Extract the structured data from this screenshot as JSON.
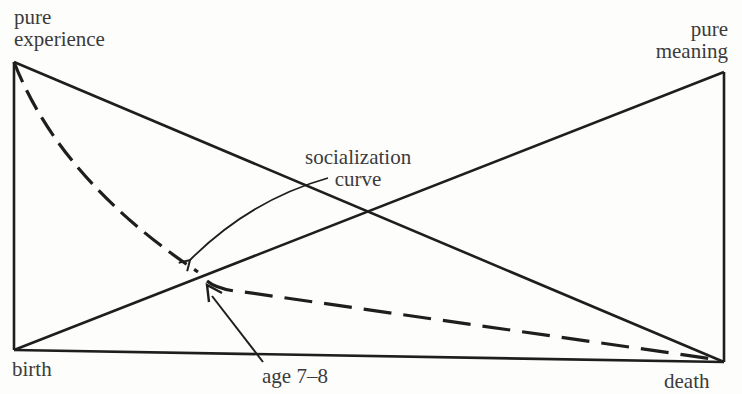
{
  "diagram": {
    "type": "conceptual-life-diagram",
    "labels": {
      "top_left": [
        "pure",
        "experience"
      ],
      "top_right": [
        "pure",
        "meaning"
      ],
      "socialization": [
        "socialization",
        "curve"
      ],
      "bottom_left": "birth",
      "bottom_right": "death",
      "age_marker": "age 7–8"
    },
    "colors": {
      "line": "#1e1e1e",
      "text": "#3b3b3b",
      "background": "#fdfdfc"
    },
    "elements": {
      "experience_line": "solid diagonal from pure experience (birth, top) to death",
      "meaning_line": "solid diagonal from birth to pure meaning (death, top)",
      "socialization_curve": "dashed curve from pure experience dropping steeply until age 7–8, then slowly declining to death",
      "socialization_arrow": "curved arrow from 'socialization curve' label to the dashed curve",
      "age_arrow": "straight arrow from 'age 7–8' label to the bend in the curve"
    }
  }
}
